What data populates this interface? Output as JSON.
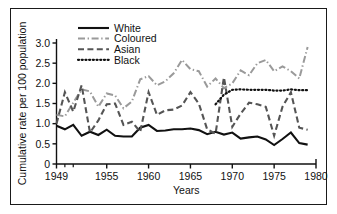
{
  "figure": {
    "frame_border_color": "#1a1a1a",
    "background": "#ffffff"
  },
  "chart_data": {
    "type": "line",
    "title": "",
    "xlabel": "Years",
    "ylabel": "Cumulative rate per 100 population",
    "xlim": [
      1949,
      1980
    ],
    "ylim": [
      0,
      3.0
    ],
    "xticks": [
      1949,
      1955,
      1960,
      1965,
      1970,
      1975,
      1980
    ],
    "xtick_labels": [
      "1949",
      "1955",
      "1960",
      "1965",
      "1970",
      "1975",
      "1980"
    ],
    "minor_xticks": [
      1950,
      1951
    ],
    "yticks": [
      0,
      0.5,
      1.0,
      1.5,
      2.0,
      2.5,
      3.0
    ],
    "ytick_labels": [
      "0",
      "0.5",
      "1.0",
      "1.5",
      "2.0",
      "2.5",
      "3.0"
    ],
    "grid": false,
    "legend_position": "top-center",
    "series": [
      {
        "name": "White",
        "color": "#111111",
        "dash": "solid",
        "width": 2.1,
        "x": [
          1949,
          1950,
          1951,
          1952,
          1953,
          1954,
          1955,
          1956,
          1957,
          1958,
          1959,
          1960,
          1961,
          1962,
          1963,
          1964,
          1965,
          1966,
          1967,
          1968,
          1969,
          1970,
          1971,
          1972,
          1973,
          1974,
          1975,
          1976,
          1977,
          1978,
          1979
        ],
        "values": [
          0.95,
          0.86,
          0.97,
          0.7,
          0.8,
          0.72,
          0.85,
          0.7,
          0.68,
          0.68,
          0.9,
          0.97,
          0.82,
          0.83,
          0.86,
          0.86,
          0.88,
          0.84,
          0.74,
          0.8,
          0.73,
          0.78,
          0.63,
          0.66,
          0.68,
          0.61,
          0.47,
          0.62,
          0.78,
          0.52,
          0.48
        ]
      },
      {
        "name": "Coloured",
        "color": "#9a9a9a",
        "dash": "dashdot",
        "width": 2.0,
        "x": [
          1949,
          1950,
          1951,
          1952,
          1953,
          1954,
          1955,
          1956,
          1957,
          1958,
          1959,
          1960,
          1961,
          1962,
          1963,
          1964,
          1965,
          1966,
          1967,
          1968,
          1969,
          1970,
          1971,
          1972,
          1973,
          1974,
          1975,
          1976,
          1977,
          1978,
          1979
        ],
        "values": [
          1.22,
          1.18,
          1.52,
          1.85,
          1.8,
          1.42,
          1.75,
          1.7,
          1.38,
          1.55,
          2.1,
          2.18,
          1.95,
          2.05,
          2.25,
          2.58,
          2.35,
          2.3,
          1.92,
          2.12,
          1.88,
          2.0,
          2.32,
          2.2,
          2.5,
          2.58,
          2.3,
          2.42,
          2.3,
          2.12,
          2.9
        ]
      },
      {
        "name": "Asian",
        "color": "#555555",
        "dash": "dashed",
        "width": 2.1,
        "x": [
          1949,
          1950,
          1951,
          1952,
          1953,
          1954,
          1955,
          1956,
          1957,
          1958,
          1959,
          1960,
          1961,
          1962,
          1963,
          1964,
          1965,
          1966,
          1967,
          1968,
          1969,
          1970,
          1971,
          1972,
          1973,
          1974,
          1975,
          1976,
          1977,
          1978,
          1979
        ],
        "values": [
          1.0,
          1.78,
          1.3,
          1.95,
          0.78,
          1.08,
          1.48,
          1.5,
          0.97,
          1.05,
          0.8,
          1.78,
          1.22,
          1.33,
          1.35,
          1.45,
          1.78,
          1.5,
          0.86,
          0.75,
          2.15,
          0.92,
          1.25,
          1.52,
          1.48,
          1.42,
          0.7,
          1.42,
          1.78,
          0.9,
          0.85
        ]
      },
      {
        "name": "Black",
        "color": "#111111",
        "dash": "dotted",
        "width": 2.2,
        "x": [
          1968,
          1969,
          1970,
          1971,
          1972,
          1973,
          1974,
          1975,
          1976,
          1977,
          1978,
          1979
        ],
        "values": [
          1.48,
          1.72,
          1.84,
          1.85,
          1.84,
          1.84,
          1.84,
          1.82,
          1.82,
          1.85,
          1.83,
          1.83
        ]
      }
    ]
  },
  "legend": {
    "entries": [
      {
        "label": "White"
      },
      {
        "label": "Coloured"
      },
      {
        "label": "Asian"
      },
      {
        "label": "Black"
      }
    ]
  }
}
